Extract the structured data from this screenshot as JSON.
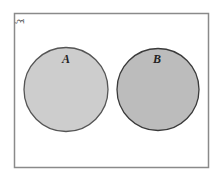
{
  "diagram": {
    "type": "venn",
    "universal_set_label": "ξ",
    "sets": [
      {
        "label": "A",
        "fill": "#cdcdcd",
        "stroke": "#555555"
      },
      {
        "label": "B",
        "fill": "#bcbcbc",
        "stroke": "#3a3a3a"
      }
    ],
    "overlap": false,
    "frame_color": "#8a8a8a"
  }
}
